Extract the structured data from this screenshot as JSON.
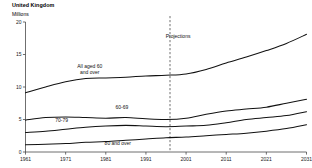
{
  "header": {
    "title": "United Kingdom",
    "units_label": "Millions"
  },
  "chart_data": {
    "type": "line",
    "title": "United Kingdom",
    "subtitle": "Millions",
    "xlabel": "",
    "ylabel": "Millions",
    "xlim": [
      1961,
      2031
    ],
    "ylim": [
      0,
      20
    ],
    "yticks": [
      0,
      5,
      10,
      15,
      20
    ],
    "ytick_labels": [
      "0",
      "5",
      "10",
      "15",
      "20"
    ],
    "xticks": [
      1961,
      1971,
      1981,
      1991,
      2001,
      2011,
      2021,
      2031
    ],
    "xtick_labels": [
      "1961",
      "1971",
      "1981",
      "1991",
      "2001",
      "2011",
      "2021",
      "2031"
    ],
    "grid": false,
    "legend_position": "inline-annotations",
    "annotations": [
      {
        "name": "projections-label",
        "text": "Projections",
        "x": 1999,
        "y": 17.6
      },
      {
        "name": "series-label-all-60-plus",
        "text": "All aged 60\nand over",
        "x": 1977,
        "y": 13.0
      },
      {
        "name": "series-label-60-69",
        "text": "60-69",
        "x": 1985,
        "y": 6.6
      },
      {
        "name": "series-label-70-79",
        "text": "70-79",
        "x": 1970,
        "y": 4.6
      },
      {
        "name": "series-label-80-plus",
        "text": "80 and over",
        "x": 1984,
        "y": 1.1
      }
    ],
    "projection_start": 1997,
    "x": [
      1961,
      1966,
      1971,
      1976,
      1981,
      1986,
      1991,
      1996,
      2001,
      2006,
      2011,
      2016,
      2021,
      2026,
      2031
    ],
    "series": [
      {
        "name": "All aged 60 and over",
        "values": [
          9.1,
          10.0,
          10.8,
          11.3,
          11.4,
          11.5,
          11.7,
          11.8,
          12.0,
          12.7,
          13.7,
          14.6,
          15.6,
          16.7,
          18.1
        ]
      },
      {
        "name": "60-69",
        "values": [
          4.9,
          5.3,
          5.4,
          5.3,
          5.2,
          5.3,
          5.1,
          5.0,
          5.2,
          5.8,
          6.3,
          6.6,
          6.9,
          7.5,
          8.1
        ]
      },
      {
        "name": "70-79",
        "values": [
          3.0,
          3.2,
          3.5,
          3.8,
          4.0,
          4.1,
          4.0,
          3.9,
          4.0,
          4.1,
          4.5,
          5.0,
          5.3,
          5.6,
          6.2
        ]
      },
      {
        "name": "80 and over",
        "values": [
          1.1,
          1.2,
          1.3,
          1.5,
          1.6,
          1.8,
          2.0,
          2.2,
          2.3,
          2.5,
          2.7,
          2.9,
          3.2,
          3.6,
          4.2
        ]
      }
    ]
  }
}
